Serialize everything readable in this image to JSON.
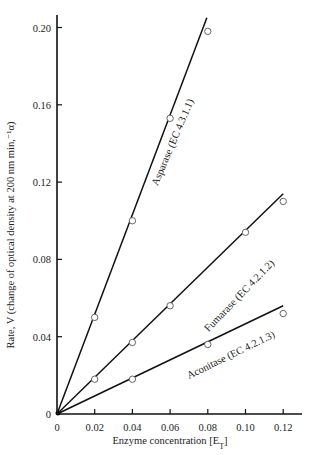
{
  "chart_data": {
    "type": "line",
    "title": "",
    "xlabel": "Enzyme concentration [E",
    "xlabel_subscript": "T",
    "xlabel_suffix": "]",
    "ylabel": "Rate, V (change of optical density at 200 nm min,⁻¹α)",
    "xlim": [
      0,
      0.13
    ],
    "ylim": [
      0,
      0.205
    ],
    "xticks": [
      0,
      0.02,
      0.04,
      0.06,
      0.08,
      0.1,
      0.12
    ],
    "xtick_labels": [
      "0",
      "0.02",
      "0.04",
      "0.06",
      "0.08",
      "0.10",
      "0.12"
    ],
    "yticks": [
      0,
      0.04,
      0.08,
      0.12,
      0.16,
      0.2
    ],
    "ytick_labels": [
      "0",
      "0.04",
      "0.08",
      "0.12",
      "0.16",
      "0.20"
    ],
    "grid": false,
    "legend": "none (inline labels along lines)",
    "series": [
      {
        "name": "Asparase (EC 4.3.1.1)",
        "fit_line": [
          [
            0,
            0
          ],
          [
            0.0795,
            0.205
          ]
        ],
        "points": [
          [
            0.02,
            0.05
          ],
          [
            0.04,
            0.1
          ],
          [
            0.06,
            0.153
          ],
          [
            0.08,
            0.198
          ]
        ]
      },
      {
        "name": "Fumarase (EC 4.2.1.2)",
        "fit_line": [
          [
            0,
            0
          ],
          [
            0.12,
            0.114
          ]
        ],
        "points": [
          [
            0.02,
            0.018
          ],
          [
            0.04,
            0.037
          ],
          [
            0.06,
            0.056
          ],
          [
            0.1,
            0.094
          ],
          [
            0.12,
            0.11
          ]
        ]
      },
      {
        "name": "Aconitase (EC 4.2.1.3)",
        "fit_line": [
          [
            0,
            0
          ],
          [
            0.12,
            0.056
          ]
        ],
        "points": [
          [
            0.04,
            0.018
          ],
          [
            0.08,
            0.036
          ],
          [
            0.12,
            0.052
          ]
        ]
      }
    ]
  }
}
